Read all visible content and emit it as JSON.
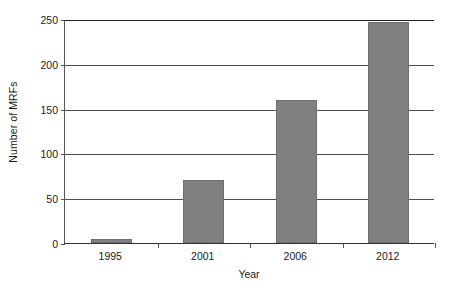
{
  "chart_data": {
    "type": "bar",
    "title": "",
    "subtitle": "",
    "xlabel": "Year",
    "ylabel": "Number of MRFs",
    "categories": [
      "1995",
      "2001",
      "2006",
      "2012"
    ],
    "values": [
      5,
      70,
      160,
      247
    ],
    "series": [
      {
        "name": "Number of MRFs",
        "values": [
          5,
          70,
          160,
          247
        ]
      }
    ],
    "ylim": [
      0,
      250
    ],
    "y_ticks": [
      0,
      50,
      100,
      150,
      200,
      250
    ],
    "y_tick_labels": [
      "0",
      "50",
      "100",
      "150",
      "200",
      "250"
    ],
    "grid": "horizontal",
    "legend": "none",
    "annotations": [],
    "bar_color": "#808080",
    "bar_edge_color": "#6e6e6e",
    "gridline_color": "#4d4d4d",
    "axis_color": "#333333",
    "text_color": "#1a1a1a",
    "background_color": "#ffffff"
  }
}
